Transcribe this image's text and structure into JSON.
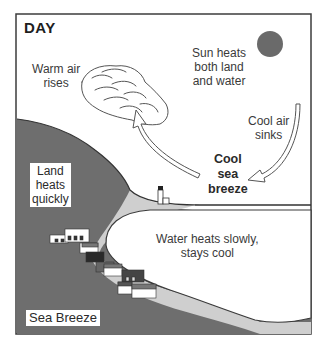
{
  "diagram": {
    "title": "DAY",
    "caption": "Sea Breeze",
    "labels": {
      "warm_air": [
        "Warm air",
        "rises"
      ],
      "sun_heats": [
        "Sun heats",
        "both land",
        "and water"
      ],
      "cool_air_sinks": [
        "Cool air",
        "sinks"
      ],
      "cool_sea_breeze": [
        "Cool",
        "sea",
        "breeze"
      ],
      "land_heats": [
        "Land",
        "heats",
        "quickly"
      ],
      "water_heats": [
        "Water heats slowly,",
        "stays cool"
      ]
    },
    "icons": {
      "sun": "sun-icon",
      "cloud": "cloud-icon",
      "lighthouse": "lighthouse-icon",
      "rising_arrow": "arrow-up-icon",
      "sinking_arrow": "arrow-down-icon",
      "houses": "houses-icon"
    },
    "colors": {
      "land": "#6e6e6e",
      "beach": "#cfcfcf",
      "water": "#ffffff",
      "sun": "#6a6a6a",
      "frame": "#3c3c3c",
      "text": "#3a3a3a"
    }
  }
}
